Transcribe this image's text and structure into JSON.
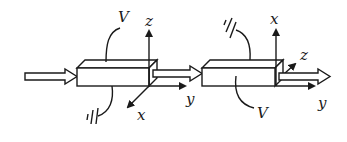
{
  "diagram": {
    "crystal1": {
      "voltage_label": "V",
      "axes": {
        "vertical": "z",
        "diagonal": "x",
        "horizontal": "y"
      }
    },
    "crystal2": {
      "voltage_label": "V",
      "axes": {
        "vertical": "x",
        "diagonal": "z",
        "horizontal": "y"
      }
    },
    "colors": {
      "line": "#1a1a1a",
      "background": "#ffffff"
    }
  }
}
